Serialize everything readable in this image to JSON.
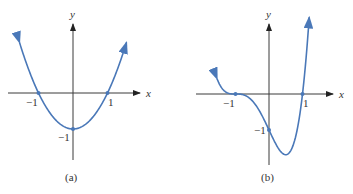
{
  "chart_data": [
    {
      "type": "line",
      "panel_label": "(a)",
      "function": "x^2 - 1",
      "xlabel": "x",
      "ylabel": "y",
      "xlim": [
        -1.55,
        1.55
      ],
      "ylim": [
        -1.0,
        1.55
      ],
      "x_ticks": [
        {
          "value": -1,
          "label": "−1"
        },
        {
          "value": 1,
          "label": "1"
        }
      ],
      "y_ticks": [
        {
          "value": -1,
          "label": "−1"
        }
      ],
      "marked_points": [
        [
          -1,
          0
        ],
        [
          1,
          0
        ],
        [
          0,
          -1
        ]
      ],
      "color": "#4a78b8"
    },
    {
      "type": "line",
      "panel_label": "(b)",
      "function": "(x+1)^3 (x-1)",
      "xlabel": "x",
      "ylabel": "y",
      "xlim": [
        -1.55,
        1.2
      ],
      "ylim": [
        -1.69,
        1.9
      ],
      "x_ticks": [
        {
          "value": -1,
          "label": "−1"
        },
        {
          "value": 1,
          "label": "1"
        }
      ],
      "y_ticks": [
        {
          "value": -1,
          "label": "−1"
        }
      ],
      "marked_points": [
        [
          -1,
          0
        ],
        [
          1,
          0
        ],
        [
          0,
          -1
        ]
      ],
      "color": "#4a78b8"
    }
  ]
}
